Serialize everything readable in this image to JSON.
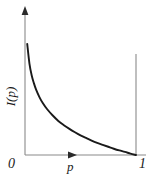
{
  "figure": {
    "name": "information-content-curve",
    "background_color": "#ffffff",
    "axis_color": "#8a8a8a",
    "curve_color": "#1a1a1a",
    "label_color": "#1a1a1a"
  },
  "labels": {
    "ylabel": "I(p)",
    "xlabel": "p",
    "tick_zero": "0",
    "tick_one": "1"
  },
  "chart_data": {
    "type": "line",
    "title": "",
    "xlabel": "p",
    "ylabel": "I(p)",
    "xlim": [
      0,
      1
    ],
    "ylim": [
      0,
      5
    ],
    "grid": false,
    "legend": null,
    "xticks": [
      0,
      1
    ],
    "xticklabels": [
      "0",
      "1"
    ],
    "yticks": [],
    "yticklabels": [],
    "annotations": [
      "y-axis terminates in an arrowhead",
      "x-axis carries a mid-axis arrowhead beneath which p is labelled",
      "vertical reference line drawn at p = 1"
    ],
    "series": [
      {
        "name": "I(p) = -log(p)",
        "x": [
          0.02,
          0.04,
          0.06,
          0.08,
          0.1,
          0.13,
          0.16,
          0.2,
          0.25,
          0.3,
          0.35,
          0.4,
          0.45,
          0.5,
          0.55,
          0.6,
          0.65,
          0.7,
          0.75,
          0.8,
          0.85,
          0.9,
          0.95,
          1.0
        ],
        "y": [
          3.91,
          3.22,
          2.81,
          2.53,
          2.3,
          2.04,
          1.83,
          1.61,
          1.39,
          1.2,
          1.05,
          0.92,
          0.8,
          0.69,
          0.6,
          0.51,
          0.43,
          0.36,
          0.29,
          0.22,
          0.16,
          0.11,
          0.05,
          0.0
        ]
      }
    ]
  }
}
